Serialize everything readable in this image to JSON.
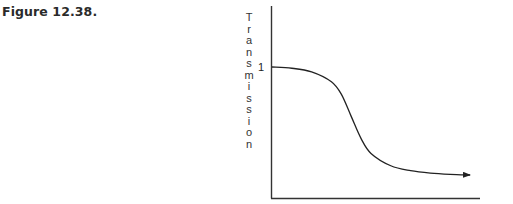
{
  "figure": {
    "caption": "Figure 12.38."
  },
  "chart_data": {
    "type": "line",
    "title": "",
    "xlabel": "",
    "ylabel": "Transmission",
    "y_ticks": [
      "1"
    ],
    "x_ticks": [],
    "grid": false,
    "legend": null,
    "annotations": [
      "arrow at end of curve indicating continuation toward asymptote"
    ],
    "series": [
      {
        "name": "Transmission curve",
        "description": "Starts at 1, stays nearly flat, then falls sigmoidally and asymptotically approaches a low value",
        "x": [
          0,
          0.1,
          0.2,
          0.3,
          0.35,
          0.4,
          0.45,
          0.5,
          0.6,
          0.7,
          0.8,
          0.9,
          1.0
        ],
        "values": [
          1.0,
          0.99,
          0.96,
          0.88,
          0.78,
          0.6,
          0.42,
          0.3,
          0.2,
          0.16,
          0.14,
          0.13,
          0.125
        ]
      }
    ],
    "ylim": [
      0,
      1.45
    ],
    "xlim": [
      0,
      1.05
    ]
  },
  "colors": {
    "line": "#222222",
    "axis": "#333333",
    "text": "#2a2a2a"
  }
}
